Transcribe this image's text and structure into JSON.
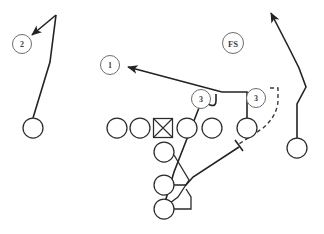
{
  "diagram": {
    "kind": "american-football-play",
    "width": 324,
    "height": 234,
    "background_color": "#ffffff",
    "line_color": "#232323",
    "defender_label_color": "#3d3d3d"
  },
  "defenders": [
    {
      "label": "2",
      "cx": 22,
      "cy": 44,
      "r": 9.5
    },
    {
      "label": "1",
      "cx": 110,
      "cy": 65,
      "r": 9.5
    },
    {
      "label": "FS",
      "cx": 233,
      "cy": 43,
      "r": 10.5
    },
    {
      "label": "3",
      "cx": 201,
      "cy": 99,
      "r": 9.5
    },
    {
      "label": "3",
      "cx": 256,
      "cy": 98,
      "r": 9.5
    }
  ],
  "offense": {
    "linemen": [
      {
        "name": "left-tackle",
        "cx": 117,
        "cy": 128,
        "r": 10
      },
      {
        "name": "left-guard",
        "cx": 140,
        "cy": 128,
        "r": 10
      },
      {
        "name": "right-guard",
        "cx": 187,
        "cy": 128,
        "r": 10
      },
      {
        "name": "right-tackle",
        "cx": 212,
        "cy": 128,
        "r": 10
      },
      {
        "name": "tight-end",
        "cx": 247,
        "cy": 128,
        "r": 10
      }
    ],
    "center": {
      "name": "center",
      "cx": 163,
      "cy": 128,
      "size": 19
    },
    "backs": [
      {
        "name": "quarterback",
        "cx": 164,
        "cy": 152,
        "r": 10
      },
      {
        "name": "halfback",
        "cx": 164,
        "cy": 185,
        "r": 10
      },
      {
        "name": "fullback",
        "cx": 164,
        "cy": 209,
        "r": 10
      }
    ],
    "receivers": [
      {
        "name": "split-end",
        "cx": 33,
        "cy": 128,
        "r": 10
      },
      {
        "name": "flanker",
        "cx": 297,
        "cy": 148,
        "r": 10
      }
    ]
  },
  "routes": [
    {
      "name": "split-end-route",
      "style": "solid",
      "arrow": true,
      "points": "33,118 50,62 55,16"
    },
    {
      "name": "split-end-arrow-break",
      "style": "solid",
      "arrow": true,
      "points": "55,16 30,36"
    },
    {
      "name": "flanker-route",
      "style": "solid",
      "arrow": true,
      "points": "297,138 297,104 305,88 300,70 290,48 270,12"
    },
    {
      "name": "tight-end-release",
      "style": "solid",
      "arrow": false,
      "points": "247,118 247,92 222,92"
    },
    {
      "name": "drag-crossing-route",
      "style": "solid",
      "arrow": true,
      "points": "222,92 130,68"
    },
    {
      "name": "inside-hook-route",
      "style": "solid",
      "arrow": false,
      "points": "216,94 216,100 210,103 205,100 204,93"
    },
    {
      "name": "deep-cross-stem",
      "style": "solid",
      "arrow": false,
      "points": "204,93 172,175 160,218"
    },
    {
      "name": "quarterback-path",
      "style": "solid",
      "arrow": false,
      "points": "174,157 188,180 178,196 169,203"
    },
    {
      "name": "halfback-swing",
      "style": "solid",
      "arrow": false,
      "points": "174,185 185,185 192,176 240,147"
    },
    {
      "name": "fullback-path",
      "style": "solid",
      "arrow": false,
      "points": "174,209 190,209 190,196 186,188"
    },
    {
      "name": "motion-dashed-loop",
      "style": "dashed",
      "arrow": false,
      "points": "271,88 277,88 277,100 272,117 258,132 238,145"
    }
  ],
  "block_marks": [
    {
      "name": "block-tick-halfback",
      "points": "237,140 244,150"
    }
  ]
}
